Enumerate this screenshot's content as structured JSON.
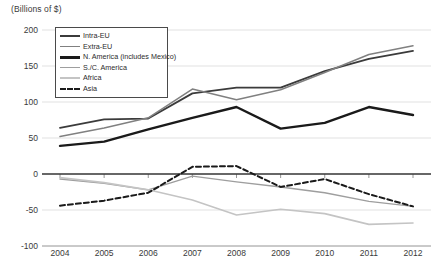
{
  "chart_data": {
    "type": "line",
    "title": "",
    "axis_unit_label": "(Billions of $)",
    "xlabel": "",
    "ylabel": "",
    "categories": [
      "2004",
      "2005",
      "2006",
      "2007",
      "2008",
      "2009",
      "2010",
      "2011",
      "2012"
    ],
    "ylim": [
      -100,
      200
    ],
    "yticks": [
      "200",
      "150",
      "100",
      "50",
      "0",
      "-50",
      "-100"
    ],
    "ytick_values": [
      200,
      150,
      100,
      50,
      0,
      -50,
      -100
    ],
    "grid": true,
    "legend_position": "upper-left-inside",
    "series": [
      {
        "name": "Intra-EU",
        "color": "#3b3b3b",
        "width": 1.8,
        "dash": "none",
        "values": [
          64,
          76,
          77,
          112,
          120,
          120,
          143,
          160,
          171
        ]
      },
      {
        "name": "Extra-EU",
        "color": "#808080",
        "width": 1.5,
        "dash": "none",
        "values": [
          52,
          64,
          78,
          118,
          103,
          117,
          141,
          166,
          178
        ]
      },
      {
        "name": "N. America (includes Mexico)",
        "color": "#1a1a1a",
        "width": 2.4,
        "dash": "none",
        "values": [
          39,
          45,
          62,
          78,
          93,
          63,
          71,
          93,
          82
        ]
      },
      {
        "name": "S./C. America",
        "color": "#9e9e9e",
        "width": 1.4,
        "dash": "none",
        "values": [
          -7,
          -13,
          -22,
          -3,
          -11,
          -18,
          -26,
          -38,
          -45
        ]
      },
      {
        "name": "Africa",
        "color": "#c4c4c4",
        "width": 1.6,
        "dash": "none",
        "values": [
          -5,
          -12,
          -22,
          -36,
          -57,
          -49,
          -55,
          -70,
          -68
        ]
      },
      {
        "name": "Asia",
        "color": "#1a1a1a",
        "width": 2.0,
        "dash": "5,3",
        "values": [
          -44,
          -37,
          -26,
          10,
          11,
          -18,
          -7,
          -28,
          -45
        ]
      }
    ]
  },
  "legend": {
    "items": [
      {
        "label": "Intra-EU"
      },
      {
        "label": "Extra-EU"
      },
      {
        "label": "N. America (includes Mexico)"
      },
      {
        "label": "S./C. America"
      },
      {
        "label": "Africa"
      },
      {
        "label": "Asia"
      }
    ]
  },
  "colors": {
    "grid": "#d9d9d9",
    "frame": "#9a9a9a",
    "text": "#3a3a3a",
    "background": "#ffffff"
  }
}
